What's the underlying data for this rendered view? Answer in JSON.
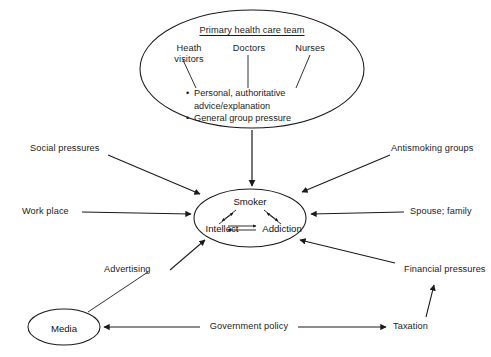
{
  "diagram": {
    "title_hidden": "Influences on the smoker",
    "top_group": {
      "heading": "Primary health care team",
      "members": [
        {
          "label": "Heath\nvisitors"
        },
        {
          "label": "Doctors"
        },
        {
          "label": "Nurses"
        }
      ],
      "bullets": [
        "Personal, authoritative\nadvice/explanation",
        "General group pressure"
      ],
      "bullet_marker": "•"
    },
    "center": {
      "title": "Smoker",
      "left_term": "Intellect",
      "right_term": "Addiction"
    },
    "influences": {
      "left": [
        {
          "label": "Social pressures"
        },
        {
          "label": "Work place"
        },
        {
          "label": "Advertising"
        }
      ],
      "right": [
        {
          "label": "Antismoking groups"
        },
        {
          "label": "Spouse; family"
        },
        {
          "label": "Financial pressures"
        }
      ]
    },
    "bottom": {
      "media": "Media",
      "policy": "Government policy",
      "taxation": "Taxation"
    },
    "colors": {
      "stroke": "#1a1a1a",
      "text": "#1c1c1c",
      "background": "#ffffff"
    }
  }
}
